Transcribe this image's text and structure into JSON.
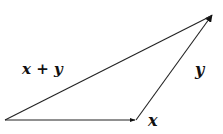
{
  "diagram": {
    "type": "vector-addition-triangle",
    "vectors": [
      {
        "name": "x",
        "label": "x",
        "from": [
          5,
          120
        ],
        "to": [
          136,
          120
        ]
      },
      {
        "name": "y",
        "label": "y",
        "from": [
          136,
          120
        ],
        "to": [
          213,
          14
        ]
      },
      {
        "name": "x_plus_y",
        "label": "x + y",
        "from": [
          5,
          120
        ],
        "to": [
          213,
          14
        ]
      }
    ],
    "labels": {
      "x": "x",
      "y": "y",
      "sum": "x + y"
    },
    "colors": {
      "stroke": "#222222",
      "background": "#ffffff"
    }
  }
}
